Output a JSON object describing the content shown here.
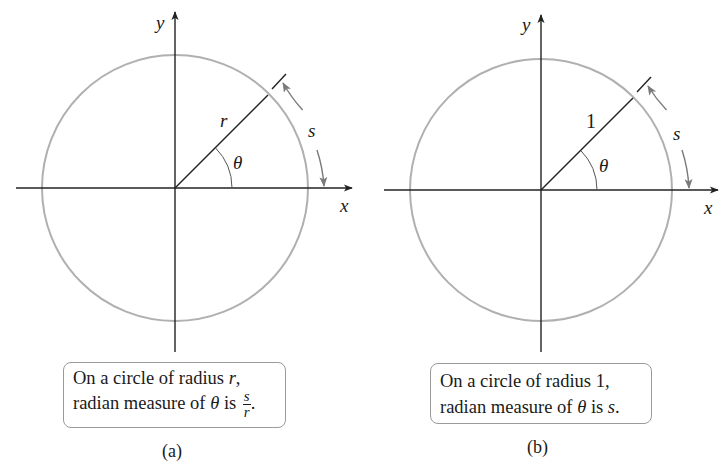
{
  "panels": [
    {
      "id": "a",
      "axis_x_label": "x",
      "axis_y_label": "y",
      "radius_label": "r",
      "angle_label": "θ",
      "arc_label": "s",
      "caption": {
        "line1_prefix": "On a circle of radius ",
        "line1_var": "r",
        "line1_suffix": ",",
        "line2_prefix": "radian measure of ",
        "line2_var": "θ",
        "line2_mid": " is ",
        "fraction_numerator": "s",
        "fraction_denominator": "r",
        "line2_suffix": "."
      },
      "sublabel": "(a)"
    },
    {
      "id": "b",
      "axis_x_label": "x",
      "axis_y_label": "y",
      "radius_label": "1",
      "angle_label": "θ",
      "arc_label": "s",
      "caption": {
        "line1_prefix": "On a circle of radius 1,",
        "line2_prefix": "radian measure of ",
        "line2_var": "θ",
        "line2_mid": " is ",
        "line2_end_var": "s",
        "line2_suffix": "."
      },
      "sublabel": "(b)"
    }
  ],
  "colors": {
    "axis": "#222222",
    "circle": "#b0b0b0",
    "arc_arrow": "#7a7a7a",
    "box_border": "#9a9a9a"
  }
}
